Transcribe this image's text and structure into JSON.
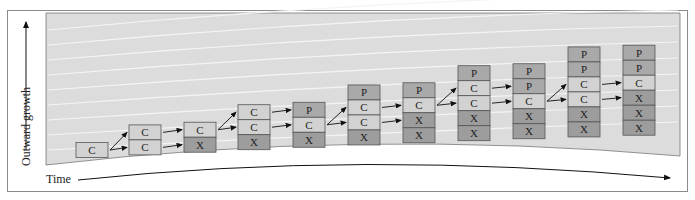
{
  "axes": {
    "y_label": "Outward growth",
    "x_label": "Time"
  },
  "colors": {
    "panel": "#dcdcdc",
    "stripe": "#ececec",
    "cell_C": "#d2d2d2",
    "cell_P": "#a9a9a9",
    "cell_X": "#9d9d9d",
    "border": "#555555"
  },
  "stacks": [
    {
      "x": 76,
      "cells": [
        "C"
      ]
    },
    {
      "x": 129,
      "cells": [
        "C",
        "C"
      ]
    },
    {
      "x": 184,
      "cells": [
        "C",
        "X"
      ]
    },
    {
      "x": 238,
      "cells": [
        "C",
        "C",
        "X"
      ]
    },
    {
      "x": 293,
      "cells": [
        "P",
        "C",
        "X"
      ]
    },
    {
      "x": 348,
      "cells": [
        "P",
        "C",
        "C",
        "X"
      ]
    },
    {
      "x": 403,
      "cells": [
        "P",
        "C",
        "X",
        "X"
      ]
    },
    {
      "x": 458,
      "cells": [
        "P",
        "C",
        "C",
        "X",
        "X"
      ]
    },
    {
      "x": 513,
      "cells": [
        "P",
        "P",
        "C",
        "X",
        "X"
      ]
    },
    {
      "x": 568,
      "cells": [
        "P",
        "P",
        "C",
        "C",
        "X",
        "X"
      ]
    },
    {
      "x": 623,
      "cells": [
        "P",
        "P",
        "C",
        "X",
        "X",
        "X"
      ]
    }
  ]
}
